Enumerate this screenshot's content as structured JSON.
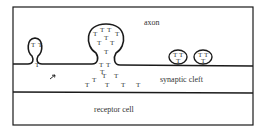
{
  "diagram": {
    "labels": {
      "axon": "axon",
      "cleft": "synaptic cleft",
      "receptor": "receptor cell"
    },
    "transmitter_symbol": "T",
    "stroke_color": "#1a1a1a",
    "small_vesicle_fusing": {
      "contents": [
        "T",
        "T",
        "T"
      ]
    },
    "large_vesicle_fusing": {
      "contents": [
        "T",
        "T",
        "T",
        "T",
        "T",
        "T",
        "T",
        "T",
        "T"
      ]
    },
    "released_transmitters": [
      "T",
      "T",
      "T",
      "T",
      "T",
      "T",
      "T",
      "T",
      "T",
      "T"
    ],
    "free_vesicles": [
      {
        "contents": [
          "T",
          "T",
          "T"
        ]
      },
      {
        "contents": [
          "T",
          "T",
          "T"
        ]
      }
    ],
    "arrow_marker": "arrow"
  }
}
